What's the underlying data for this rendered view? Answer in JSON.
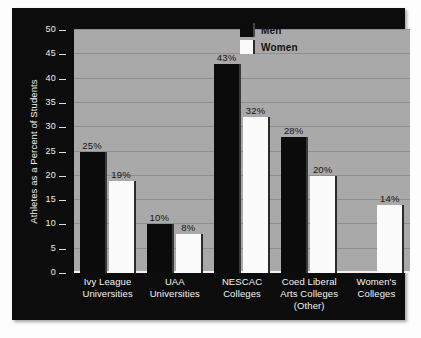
{
  "chart_data": {
    "type": "bar",
    "title": "",
    "xlabel": "",
    "ylabel": "Athletes as a Percent of Students",
    "ylim": [
      0,
      50
    ],
    "ytick_values": [
      0,
      5,
      10,
      15,
      20,
      25,
      30,
      35,
      40,
      45,
      50
    ],
    "ytick_labels": [
      "0",
      "5",
      "10",
      "15",
      "20",
      "25",
      "30",
      "35",
      "40",
      "45",
      "50"
    ],
    "grid": true,
    "legend_position": "top-right",
    "categories": [
      "Ivy League Universities",
      "UAA Universities",
      "NESCAC Colleges",
      "Coed Liberal Arts Colleges (Other)",
      "Women's Colleges"
    ],
    "category_label_lines": [
      [
        "Ivy League",
        "Universities"
      ],
      [
        "UAA",
        "Universities"
      ],
      [
        "NESCAC",
        "Colleges"
      ],
      [
        "Coed Liberal",
        "Arts Colleges",
        "(Other)"
      ],
      [
        "Women's",
        "Colleges"
      ]
    ],
    "series": [
      {
        "name": "Men",
        "color": "#0b0b0b",
        "values": [
          25,
          10,
          43,
          28,
          null
        ],
        "data_labels": [
          "25%",
          "10%",
          "43%",
          "28%",
          ""
        ]
      },
      {
        "name": "Women",
        "color": "#fbfbfb",
        "values": [
          19,
          8,
          32,
          20,
          14
        ],
        "data_labels": [
          "19%",
          "8%",
          "32%",
          "20%",
          "14%"
        ]
      }
    ]
  },
  "legend": {
    "items": [
      {
        "label": "Men",
        "swatch": "men"
      },
      {
        "label": "Women",
        "swatch": "women"
      }
    ]
  },
  "ghost_text": ""
}
